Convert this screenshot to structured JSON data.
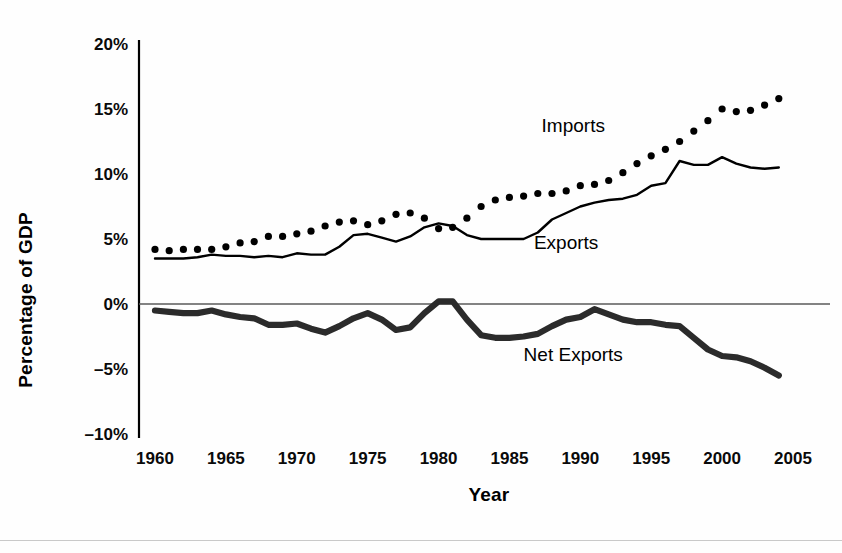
{
  "chart_data": {
    "type": "line",
    "title": "",
    "subtitle": "",
    "xlabel": "Year",
    "ylabel": "Percentage of GDP",
    "xlim": [
      1960,
      2005
    ],
    "ylim": [
      -10,
      20
    ],
    "xticks": [
      1960,
      1965,
      1970,
      1975,
      1980,
      1985,
      1990,
      1995,
      2000,
      2005
    ],
    "xtick_labels": [
      "1960",
      "1965",
      "1970",
      "1975",
      "1980",
      "1985",
      "1990",
      "1995",
      "2000",
      "2005"
    ],
    "yticks": [
      20,
      15,
      10,
      5,
      0,
      -5,
      -10
    ],
    "ytick_labels": [
      "20%",
      "15%",
      "10%",
      "5%",
      "0%",
      "–5%",
      "–10%"
    ],
    "grid": false,
    "zero_line": true,
    "legend": "inline-annotations",
    "annotations": [
      {
        "text": "Imports",
        "year": 1989.5,
        "value": 13.2
      },
      {
        "text": "Exports",
        "year": 1989.0,
        "value": 4.2
      },
      {
        "text": "Net Exports",
        "year": 1989.5,
        "value": -4.4
      }
    ],
    "x": [
      1960,
      1961,
      1962,
      1963,
      1964,
      1965,
      1966,
      1967,
      1968,
      1969,
      1970,
      1971,
      1972,
      1973,
      1974,
      1975,
      1976,
      1977,
      1978,
      1979,
      1980,
      1981,
      1982,
      1983,
      1984,
      1985,
      1986,
      1987,
      1988,
      1989,
      1990,
      1991,
      1992,
      1993,
      1994,
      1995,
      1996,
      1997,
      1998,
      1999,
      2000,
      2001,
      2002,
      2003,
      2004
    ],
    "series": [
      {
        "name": "Imports",
        "style": "dotted",
        "color": "#000000",
        "values": [
          4.2,
          4.1,
          4.2,
          4.2,
          4.2,
          4.4,
          4.7,
          4.8,
          5.2,
          5.2,
          5.4,
          5.6,
          6.0,
          6.3,
          6.4,
          6.1,
          6.4,
          6.9,
          7.0,
          6.6,
          5.8,
          5.9,
          6.6,
          7.5,
          8.0,
          8.2,
          8.3,
          8.5,
          8.5,
          8.7,
          9.1,
          9.2,
          9.5,
          10.1,
          10.8,
          11.4,
          11.9,
          12.5,
          13.3,
          14.1,
          15.0,
          14.8,
          14.9,
          15.3,
          15.8
        ]
      },
      {
        "name": "Exports",
        "style": "solid-thin",
        "color": "#000000",
        "values": [
          3.5,
          3.5,
          3.5,
          3.6,
          3.8,
          3.7,
          3.7,
          3.6,
          3.7,
          3.6,
          3.9,
          3.8,
          3.8,
          4.4,
          5.3,
          5.4,
          5.1,
          4.8,
          5.2,
          5.9,
          6.2,
          6.0,
          5.3,
          5.0,
          5.0,
          5.0,
          5.0,
          5.5,
          6.5,
          7.0,
          7.5,
          7.8,
          8.0,
          8.1,
          8.4,
          9.1,
          9.3,
          11.0,
          10.7,
          10.7,
          11.3,
          10.8,
          10.5,
          10.4,
          10.5
        ]
      },
      {
        "name": "Net Exports",
        "style": "solid-thick",
        "color": "#2b2b2b",
        "values": [
          -0.5,
          -0.6,
          -0.7,
          -0.7,
          -0.5,
          -0.8,
          -1.0,
          -1.1,
          -1.6,
          -1.6,
          -1.5,
          -1.9,
          -2.2,
          -1.7,
          -1.1,
          -0.7,
          -1.2,
          -2.0,
          -1.8,
          -0.7,
          0.2,
          0.2,
          -1.2,
          -2.4,
          -2.6,
          -2.6,
          -2.5,
          -2.3,
          -1.7,
          -1.2,
          -1.0,
          -0.4,
          -0.8,
          -1.2,
          -1.4,
          -1.4,
          -1.6,
          -1.7,
          -2.6,
          -3.5,
          -4.0,
          -4.1,
          -4.4,
          -4.9,
          -5.5
        ]
      }
    ]
  },
  "axes": {
    "ylabel_text": "Percentage of GDP",
    "xlabel_text": "Year"
  }
}
